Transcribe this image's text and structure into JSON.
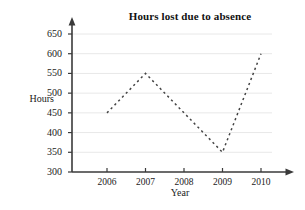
{
  "chart_data": {
    "type": "line",
    "title": "Hours lost due to absence",
    "xlabel": "Year",
    "ylabel": "Hours",
    "categories": [
      "2006",
      "2007",
      "2008",
      "2009",
      "2010"
    ],
    "x": [
      2006,
      2007,
      2008,
      2009,
      2010
    ],
    "values": [
      450,
      550,
      450,
      350,
      600
    ],
    "series": [
      {
        "name": "Hours lost",
        "values": [
          450,
          550,
          450,
          350,
          600
        ],
        "style": "dashed",
        "color": "#444444",
        "markers": false
      }
    ],
    "ylim": [
      300,
      650
    ],
    "yticks": [
      300,
      350,
      400,
      450,
      500,
      550,
      600,
      650
    ],
    "ytick_labels": [
      "300",
      "350",
      "400",
      "450",
      "500",
      "550",
      "600",
      "650"
    ],
    "xtick_labels": [
      "2006",
      "2007",
      "2008",
      "2009",
      "2010"
    ],
    "grid": "horizontal",
    "grid_color": "#e8e8e8",
    "axis_color": "#3a3a3a",
    "legend": null,
    "legend_position": "none",
    "axis_arrows": [
      "y-top",
      "x-right"
    ],
    "background": "#ffffff"
  }
}
